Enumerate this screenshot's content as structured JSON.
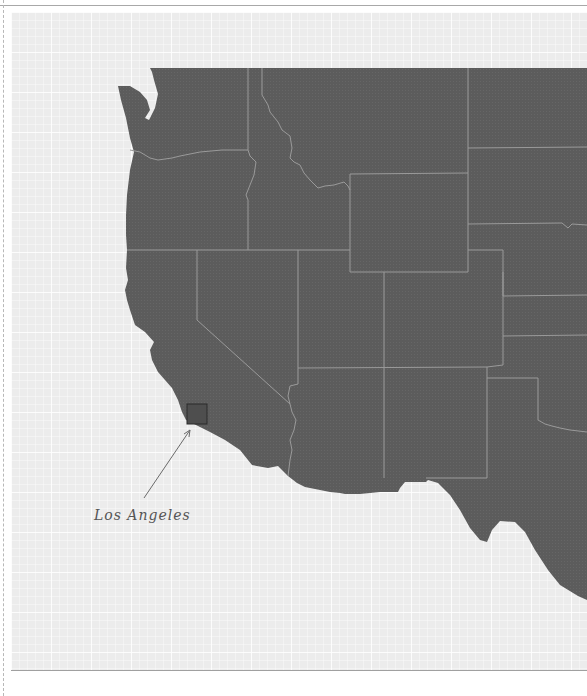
{
  "map": {
    "region": "Western United States",
    "colors": {
      "land": "#5c5c5c",
      "border": "#9a9a9a",
      "background": "#ececec",
      "highlight_outline": "#2a2a2a",
      "annotation": "#6a6a6a"
    },
    "annotations": [
      {
        "label": "Los Angeles",
        "target": "Los Angeles County",
        "label_x": 94,
        "label_y": 507
      }
    ]
  }
}
